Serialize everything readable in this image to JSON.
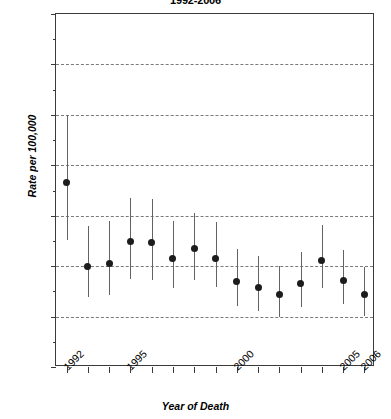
{
  "chart_data": {
    "type": "scatter",
    "title": "1992-2006",
    "xlabel": "Year of Death",
    "ylabel": "Rate per 100,000",
    "xlim": [
      1991.5,
      2006.5
    ],
    "ylim": [
      0.0,
      3.5
    ],
    "grid": true,
    "legend": null,
    "error_bars": "95% confidence interval",
    "ytick_labels": [
      "0.0",
      "0.5",
      "1.0",
      "1.5",
      "2.0",
      "2.5",
      "3.0",
      "3.5"
    ],
    "ytick_values": [
      0.0,
      0.5,
      1.0,
      1.5,
      2.0,
      2.5,
      3.0,
      3.5
    ],
    "xtick_values": [
      1992,
      1993,
      1994,
      1995,
      1996,
      1997,
      1998,
      1999,
      2000,
      2001,
      2002,
      2003,
      2004,
      2005,
      2006
    ],
    "xtick_labels_shown": [
      "1992",
      "1995",
      "2000",
      "2005",
      "2006"
    ],
    "categories": [
      1992,
      1993,
      1994,
      1995,
      1996,
      1997,
      1998,
      1999,
      2000,
      2001,
      2002,
      2003,
      2004,
      2005,
      2006
    ],
    "values": [
      1.83,
      1.0,
      1.03,
      1.24,
      1.23,
      1.08,
      1.17,
      1.08,
      0.85,
      0.79,
      0.72,
      0.83,
      1.06,
      0.86,
      0.72
    ],
    "ci_lower": [
      1.26,
      0.69,
      0.71,
      0.87,
      0.86,
      0.78,
      0.86,
      0.79,
      0.6,
      0.56,
      0.5,
      0.59,
      0.78,
      0.62,
      0.51
    ],
    "ci_upper": [
      2.5,
      1.4,
      1.45,
      1.68,
      1.67,
      1.45,
      1.53,
      1.44,
      1.17,
      1.1,
      1.0,
      1.14,
      1.41,
      1.16,
      0.99
    ],
    "points": [
      {
        "year": 1992,
        "label": "1992",
        "rate": 1.83,
        "low": 1.26,
        "high": 2.5
      },
      {
        "year": 1993,
        "label": "1993",
        "rate": 1.0,
        "low": 0.69,
        "high": 1.4
      },
      {
        "year": 1994,
        "label": "1994",
        "rate": 1.03,
        "low": 0.71,
        "high": 1.45
      },
      {
        "year": 1995,
        "label": "1995",
        "rate": 1.24,
        "low": 0.87,
        "high": 1.68
      },
      {
        "year": 1996,
        "label": "1996",
        "rate": 1.23,
        "low": 0.86,
        "high": 1.67
      },
      {
        "year": 1997,
        "label": "1997",
        "rate": 1.08,
        "low": 0.78,
        "high": 1.45
      },
      {
        "year": 1998,
        "label": "1998",
        "rate": 1.17,
        "low": 0.86,
        "high": 1.53
      },
      {
        "year": 1999,
        "label": "1999",
        "rate": 1.08,
        "low": 0.79,
        "high": 1.44
      },
      {
        "year": 2000,
        "label": "2000",
        "rate": 0.85,
        "low": 0.6,
        "high": 1.17
      },
      {
        "year": 2001,
        "label": "2001",
        "rate": 0.79,
        "low": 0.56,
        "high": 1.1
      },
      {
        "year": 2002,
        "label": "2002",
        "rate": 0.72,
        "low": 0.5,
        "high": 1.0
      },
      {
        "year": 2003,
        "label": "2003",
        "rate": 0.83,
        "low": 0.59,
        "high": 1.14
      },
      {
        "year": 2004,
        "label": "2004",
        "rate": 1.06,
        "low": 0.78,
        "high": 1.41
      },
      {
        "year": 2005,
        "label": "2005",
        "rate": 0.86,
        "low": 0.62,
        "high": 1.16
      },
      {
        "year": 2006,
        "label": "2006",
        "rate": 0.72,
        "low": 0.51,
        "high": 0.99
      }
    ],
    "colors": {
      "marker": "#1c1c1c",
      "error_bar": "#636363",
      "gridline": "#7a7a7a",
      "axis": "#3a3a3a",
      "background": "#ffffff"
    }
  }
}
